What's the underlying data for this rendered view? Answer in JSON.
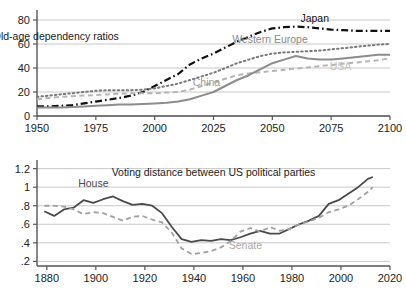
{
  "figure": {
    "panels": 2,
    "background": "#ffffff",
    "grid_color": "#c8c8c8",
    "axis_color": "#555555"
  },
  "chart_data": [
    {
      "id": "old-age-dependency",
      "type": "line",
      "title": "Old-age dependency ratios",
      "title_x": 1958,
      "title_y": 63,
      "xlabel": "",
      "ylabel": "",
      "xlim": [
        1950,
        2100
      ],
      "ylim": [
        0,
        85
      ],
      "xticks": [
        1950,
        1975,
        2000,
        2025,
        2050,
        2075,
        2100
      ],
      "yticks": [
        0,
        20,
        40,
        60,
        80
      ],
      "xticklabels": [
        "1950",
        "1975",
        "2000",
        "2025",
        "2050",
        "2075",
        "2100"
      ],
      "yticklabels": [
        "0",
        "20",
        "40",
        "60",
        "80"
      ],
      "grid": "horizontal",
      "legend": "inline-annotations",
      "x": [
        1950,
        1955,
        1960,
        1965,
        1970,
        1975,
        1980,
        1985,
        1990,
        1995,
        2000,
        2005,
        2010,
        2015,
        2020,
        2025,
        2030,
        2035,
        2040,
        2045,
        2050,
        2055,
        2060,
        2065,
        2070,
        2075,
        2080,
        2085,
        2090,
        2095,
        2100
      ],
      "series": [
        {
          "name": "Japan",
          "color": "#111111",
          "style": "dashdot",
          "width": 2.2,
          "label_x": 2068,
          "label_y": 78,
          "label_color": "#111111",
          "values": [
            8,
            8,
            8.5,
            9,
            10.5,
            12,
            13.5,
            15,
            17,
            20,
            25,
            30,
            35,
            43,
            48,
            52,
            57,
            62,
            66,
            70,
            73,
            74,
            74.5,
            74,
            73,
            72,
            71.5,
            71,
            71,
            71,
            71
          ]
        },
        {
          "name": "Western Europe",
          "color": "#787878",
          "style": "dotted",
          "width": 2.0,
          "label_x": 2049,
          "label_y": 61,
          "label_color": "#8a8a8a",
          "values": [
            16,
            17,
            18,
            19,
            20,
            21,
            21.5,
            21.5,
            21.5,
            22,
            23,
            25,
            27,
            30,
            33,
            36,
            40,
            44,
            47,
            50,
            52,
            53,
            53.5,
            54,
            54.5,
            55.5,
            56.5,
            57.5,
            58.5,
            59.5,
            60
          ]
        },
        {
          "name": "USA",
          "color": "#b4b4b4",
          "style": "dashed",
          "width": 2.0,
          "label_x": 2079,
          "label_y": 38,
          "label_color": "#c2c2c2",
          "values": [
            14,
            15,
            16,
            16.5,
            17,
            17.5,
            18,
            18.5,
            19,
            19,
            19,
            19.5,
            20,
            22,
            25,
            28,
            31,
            34,
            35.5,
            36.5,
            37.5,
            38.5,
            39.5,
            40.5,
            41.5,
            42.5,
            43.5,
            44.5,
            45.5,
            46.5,
            48
          ]
        },
        {
          "name": "China",
          "color": "#8c8c8c",
          "style": "solid",
          "width": 2.0,
          "label_x": 2022,
          "label_y": 25,
          "label_color": "#9a9a9a",
          "values": [
            7,
            7,
            7,
            7.5,
            8,
            8.5,
            9,
            9.5,
            9.5,
            10,
            10.5,
            11,
            12,
            14,
            17,
            20,
            25,
            30,
            34,
            39,
            44,
            47,
            50,
            48,
            47,
            47,
            48,
            49,
            50,
            51,
            51
          ]
        }
      ]
    },
    {
      "id": "voting-distance",
      "type": "line",
      "title": "Voting distance between US political parties",
      "title_x": 1948,
      "title_y": 1.12,
      "xlabel": "",
      "ylabel": "",
      "xlim": [
        1876,
        2020
      ],
      "ylim": [
        0.15,
        1.25
      ],
      "xticks": [
        1880,
        1900,
        1920,
        1940,
        1960,
        1980,
        2000,
        2020
      ],
      "yticks": [
        0.2,
        0.4,
        0.6,
        0.8,
        1.0,
        1.2
      ],
      "xticklabels": [
        "1880",
        "1900",
        "1920",
        "1940",
        "1960",
        "1980",
        "2000",
        "2020"
      ],
      "yticklabels": [
        ".2",
        ".4",
        ".6",
        ".8",
        "1",
        "1.2"
      ],
      "grid": "horizontal",
      "legend": "inline-annotations",
      "x": [
        1879,
        1883,
        1887,
        1891,
        1895,
        1899,
        1903,
        1907,
        1911,
        1915,
        1919,
        1923,
        1927,
        1931,
        1935,
        1939,
        1943,
        1947,
        1951,
        1955,
        1959,
        1963,
        1967,
        1971,
        1975,
        1979,
        1983,
        1987,
        1991,
        1995,
        1999,
        2003,
        2007,
        2011,
        2013
      ],
      "series": [
        {
          "name": "House",
          "color": "#4a4a4a",
          "style": "solid",
          "width": 1.8,
          "label_x": 1899,
          "label_y": 1.0,
          "label_color": "#4a4a4a",
          "values": [
            0.74,
            0.69,
            0.76,
            0.78,
            0.86,
            0.83,
            0.87,
            0.9,
            0.85,
            0.81,
            0.82,
            0.8,
            0.72,
            0.57,
            0.44,
            0.41,
            0.43,
            0.42,
            0.44,
            0.43,
            0.46,
            0.5,
            0.53,
            0.5,
            0.5,
            0.55,
            0.6,
            0.64,
            0.69,
            0.82,
            0.86,
            0.93,
            1.0,
            1.09,
            1.11
          ]
        },
        {
          "name": "Senate",
          "color": "#a0a0a0",
          "style": "dashed",
          "width": 1.8,
          "label_x": 1961,
          "label_y": 0.33,
          "label_color": "#a8a8a8",
          "values": [
            0.8,
            0.8,
            0.79,
            0.76,
            0.71,
            0.73,
            0.72,
            0.68,
            0.64,
            0.68,
            0.69,
            0.65,
            0.62,
            0.51,
            0.34,
            0.28,
            0.29,
            0.31,
            0.35,
            0.42,
            0.52,
            0.56,
            0.52,
            0.57,
            0.53,
            0.55,
            0.6,
            0.63,
            0.67,
            0.73,
            0.76,
            0.8,
            0.87,
            0.95,
            1.0
          ]
        }
      ]
    }
  ]
}
